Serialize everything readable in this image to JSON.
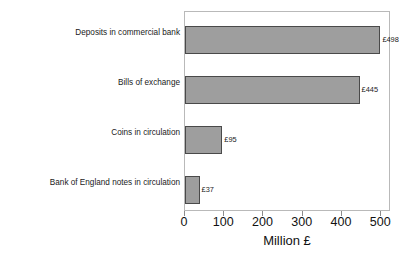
{
  "chart_data": {
    "type": "bar",
    "orientation": "horizontal",
    "title": "",
    "xlabel": "Million £",
    "ylabel": "",
    "categories": [
      "Deposits in commercial bank",
      "Bills of exchange",
      "Coins in circulation",
      "Bank of England notes in circulation"
    ],
    "values": [
      498,
      445,
      95,
      37
    ],
    "value_labels": [
      "£498",
      "£445",
      "£95",
      "£37"
    ],
    "xlim": [
      0,
      525
    ],
    "xticks": [
      0,
      100,
      200,
      300,
      400,
      500
    ],
    "xtick_labels": [
      "0",
      "100",
      "200",
      "300",
      "400",
      "500"
    ],
    "grid": false,
    "legend": false,
    "colors": {
      "bar_fill": "#9e9e9e",
      "bar_edge": "#4a4a4a",
      "frame": "#b9b9b9",
      "text": "#1a1a1a",
      "background": "#ffffff"
    }
  }
}
